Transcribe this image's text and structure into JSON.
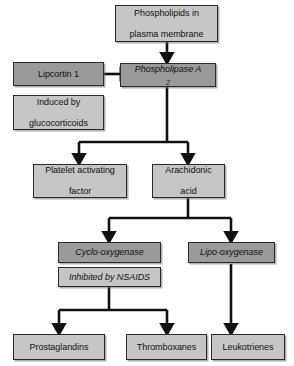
{
  "diagram": {
    "colors": {
      "box_light": "#c6c6c6",
      "box_dark": "#9a9a9a",
      "outline": "#2b2b2b",
      "arrow": "#111111",
      "background": "#ffffff"
    },
    "nodes": [
      {
        "id": "phospholipids",
        "label_lines": [
          "Phospholipids in",
          "plasma membrane"
        ],
        "label": "Phospholipids in plasma membrane",
        "shade": "light",
        "style": "normal"
      },
      {
        "id": "lipcortin",
        "label_lines": [
          "Lipcortin 1"
        ],
        "label": "Lipcortin 1",
        "shade": "dark",
        "style": "normal"
      },
      {
        "id": "glucocorticoids",
        "label_lines": [
          "Induced by",
          "glucocorticoids"
        ],
        "label": "Induced by glucocorticoids",
        "shade": "light",
        "style": "normal"
      },
      {
        "id": "phospholipase",
        "label_lines": [
          "Phospholipase A2"
        ],
        "label": "Phospholipase A2",
        "label_main": "Phospholipase A",
        "label_sub": "2",
        "shade": "dark",
        "style": "italic"
      },
      {
        "id": "platelet",
        "label_lines": [
          "Platelet activating",
          "factor"
        ],
        "label": "Platelet activating factor",
        "shade": "light",
        "style": "normal"
      },
      {
        "id": "arachidonic",
        "label_lines": [
          "Arachidonic",
          "acid"
        ],
        "label": "Arachidonic acid",
        "shade": "light",
        "style": "normal"
      },
      {
        "id": "cyclo",
        "label_lines": [
          "Cyclo-oxygenase"
        ],
        "label": "Cyclo-oxygenase",
        "shade": "dark",
        "style": "italic"
      },
      {
        "id": "nsaids",
        "label_lines": [
          "Inhibited by NSAIDS"
        ],
        "label": "Inhibited by NSAIDS",
        "shade": "light",
        "style": "italic"
      },
      {
        "id": "lipo",
        "label_lines": [
          "Lipo-oxygenase"
        ],
        "label": "Lipo-oxygenase",
        "shade": "dark",
        "style": "italic"
      },
      {
        "id": "prostaglandins",
        "label_lines": [
          "Prostaglandins"
        ],
        "label": "Prostaglandins",
        "shade": "light",
        "style": "normal"
      },
      {
        "id": "thromboxanes",
        "label_lines": [
          "Thromboxanes"
        ],
        "label": "Thromboxanes",
        "shade": "light",
        "style": "normal"
      },
      {
        "id": "leukotrienes",
        "label_lines": [
          "Leukotrienes"
        ],
        "label": "Leukotrienes",
        "shade": "light",
        "style": "normal"
      }
    ],
    "edges": [
      {
        "from": "phospholipids",
        "to": "phospholipase",
        "kind": "arrow"
      },
      {
        "from": "lipcortin",
        "to": "phospholipase",
        "kind": "inhibition"
      },
      {
        "from": "phospholipase",
        "to": "platelet",
        "kind": "arrow"
      },
      {
        "from": "phospholipase",
        "to": "arachidonic",
        "kind": "arrow"
      },
      {
        "from": "arachidonic",
        "to": "cyclo",
        "kind": "arrow"
      },
      {
        "from": "arachidonic",
        "to": "lipo",
        "kind": "arrow"
      },
      {
        "from": "cyclo",
        "to": "prostaglandins",
        "kind": "arrow"
      },
      {
        "from": "cyclo",
        "to": "thromboxanes",
        "kind": "arrow"
      },
      {
        "from": "lipo",
        "to": "leukotrienes",
        "kind": "arrow"
      }
    ]
  }
}
